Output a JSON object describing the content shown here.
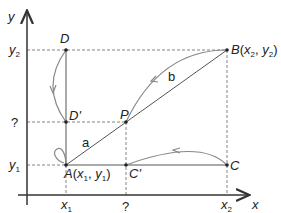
{
  "diagram": {
    "axes": {
      "x_label": "x",
      "y_label": "y"
    },
    "x_ticks": [
      {
        "base": "x",
        "sub": "1"
      },
      {
        "text": "?"
      },
      {
        "base": "x",
        "sub": "2"
      }
    ],
    "y_ticks": [
      {
        "base": "y",
        "sub": "2"
      },
      {
        "text": "?"
      },
      {
        "base": "y",
        "sub": "1"
      }
    ],
    "points": {
      "A": {
        "name": "A",
        "coords": "(x1, y1)",
        "x_base": "x",
        "x_sub": "1",
        "y_base": "y",
        "y_sub": "1"
      },
      "B": {
        "name": "B",
        "x_base": "x",
        "x_sub": "2",
        "y_base": "y",
        "y_sub": "2"
      },
      "C": {
        "name": "C"
      },
      "C_prime": {
        "name": "C'"
      },
      "D": {
        "name": "D"
      },
      "D_prime": {
        "name": "D'"
      },
      "P": {
        "name": "P"
      }
    },
    "segment_labels": {
      "a": "a",
      "b": "b"
    },
    "colors": {
      "axis": "#333333",
      "line": "#555555",
      "arc": "#888888",
      "dashed": "#666666"
    }
  }
}
